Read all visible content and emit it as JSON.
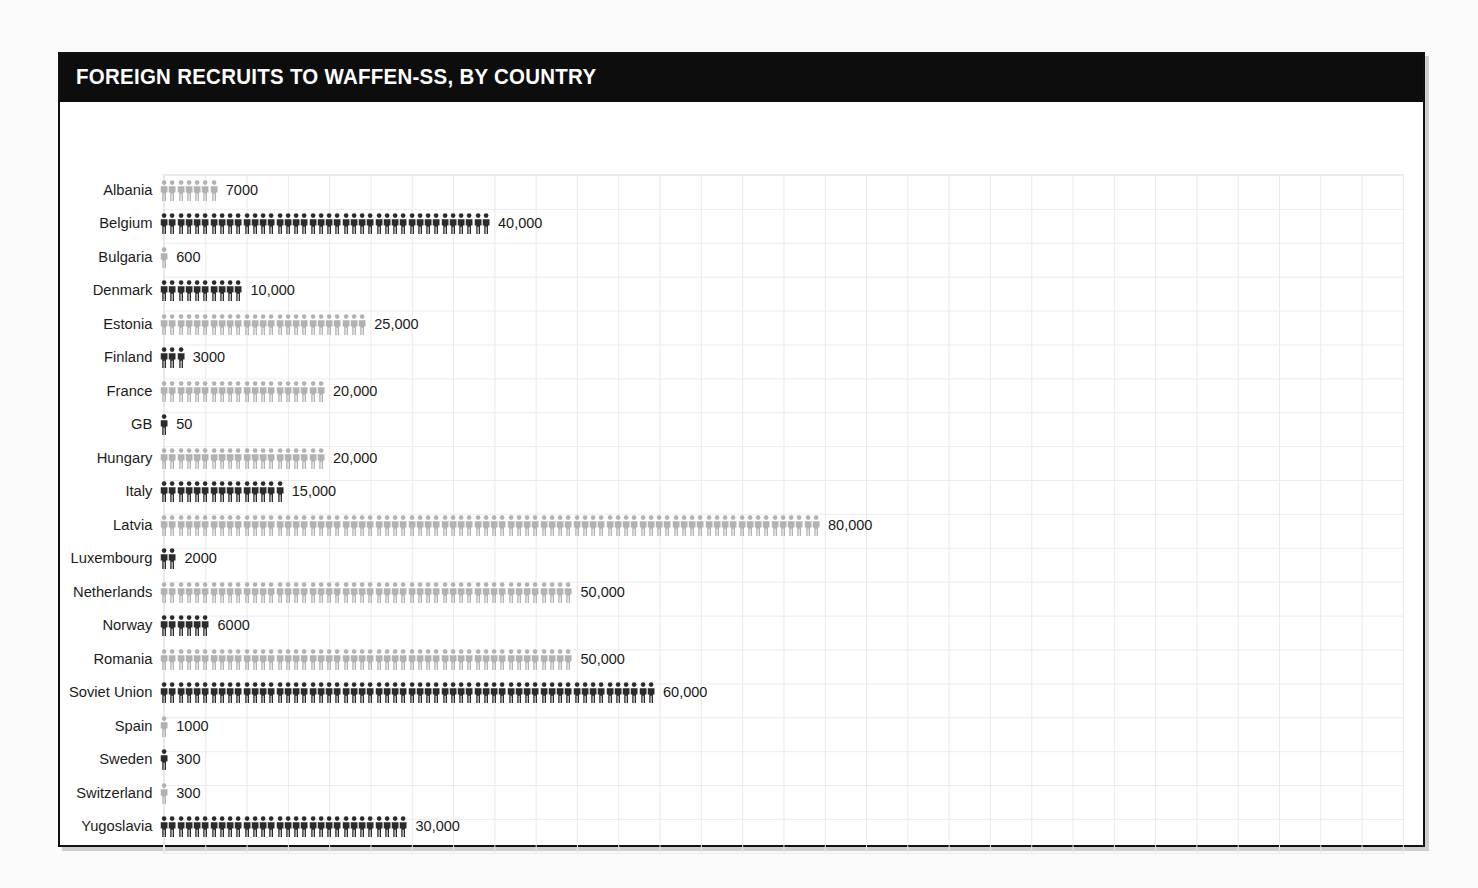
{
  "header": {
    "title": "FOREIGN RECRUITS TO WAFFEN-SS, BY COUNTRY"
  },
  "colors": {
    "title_band": "#0d0d0d",
    "title_text": "#ffffff",
    "figure_dark": "#2b2b2b",
    "figure_light": "#b2b2b2",
    "grid_line": "#e9e9ed",
    "card_border": "#121212",
    "page_background": "#fbfbfc"
  },
  "chart_data": {
    "type": "bar",
    "title": "FOREIGN RECRUITS TO WAFFEN-SS, BY COUNTRY",
    "subtitle": "",
    "xlabel": "",
    "ylabel": "",
    "grid": true,
    "legend": "none",
    "units_per_icon": 1000,
    "icon": "person-pictogram",
    "orientation": "horizontal",
    "xlim": [
      0,
      80000
    ],
    "categories": [
      "Albania",
      "Belgium",
      "Bulgaria",
      "Denmark",
      "Estonia",
      "Finland",
      "France",
      "GB",
      "Hungary",
      "Italy",
      "Latvia",
      "Luxembourg",
      "Netherlands",
      "Norway",
      "Romania",
      "Soviet Union",
      "Spain",
      "Sweden",
      "Switzerland",
      "Yugoslavia"
    ],
    "values": [
      7000,
      40000,
      600,
      10000,
      25000,
      3000,
      20000,
      50,
      20000,
      15000,
      80000,
      2000,
      50000,
      6000,
      50000,
      60000,
      1000,
      300,
      300,
      30000
    ],
    "value_labels": [
      "7000",
      "40,000",
      "600",
      "10,000",
      "25,000",
      "3000",
      "20,000",
      "50",
      "20,000",
      "15,000",
      "80,000",
      "2000",
      "50,000",
      "6000",
      "50,000",
      "60,000",
      "1000",
      "300",
      "300",
      "30,000"
    ],
    "icon_counts": [
      7,
      40,
      1,
      10,
      25,
      3,
      20,
      1,
      20,
      15,
      80,
      2,
      50,
      6,
      50,
      60,
      1,
      1,
      1,
      30
    ],
    "shades": [
      "light",
      "dark",
      "light",
      "dark",
      "light",
      "dark",
      "light",
      "dark",
      "light",
      "dark",
      "light",
      "dark",
      "light",
      "dark",
      "light",
      "dark",
      "light",
      "dark",
      "light",
      "dark"
    ]
  }
}
